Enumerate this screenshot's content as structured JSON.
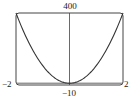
{
  "chart_data": {
    "type": "line",
    "title": "",
    "xlabel": "",
    "ylabel": "",
    "xlim": [
      -2,
      2
    ],
    "ylim": [
      -10,
      400
    ],
    "viewing_rectangle": "[-2, 2] by [-10, 400]",
    "tick_labels": {
      "x_min": "−2",
      "x_max": "2",
      "y_min": "−10",
      "y_max": "400"
    },
    "grid": false,
    "legend": null,
    "series": [
      {
        "name": "curve",
        "description": "Parabola symmetric about y-axis, minimum at origin, reaching top corners at x = ±2",
        "x": [
          -2,
          -1.5,
          -1,
          -0.5,
          0,
          0.5,
          1,
          1.5,
          2
        ],
        "y": [
          400,
          225,
          100,
          25,
          0,
          25,
          100,
          225,
          400
        ]
      }
    ],
    "color": "#333333"
  },
  "labels": {
    "top": "400",
    "bottom": "−10",
    "left": "−2",
    "right": "2"
  }
}
